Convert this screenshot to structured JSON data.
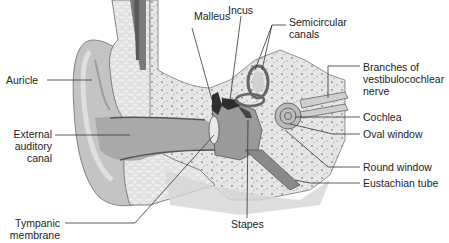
{
  "diagram": {
    "labels": {
      "malleus": "Malleus",
      "incus": "Incus",
      "semicircular_canals": [
        "Semicircular",
        "canals"
      ],
      "auricle": "Auricle",
      "branches_nerve": [
        "Branches of",
        "vestibulocochlear",
        "nerve"
      ],
      "cochlea": "Cochlea",
      "external_auditory_canal": [
        "External",
        "auditory",
        "canal"
      ],
      "oval_window": "Oval window",
      "round_window": "Round window",
      "eustachian_tube": "Eustachian tube",
      "tympanic_membrane": [
        "Tympanic",
        "membrane"
      ],
      "stapes": "Stapes"
    },
    "colors": {
      "skin": "#c8c8c8",
      "skin_dark": "#a8a8a8",
      "bone": "#e4e4e4",
      "bone_speckle": "#8a8a8a",
      "outline": "#555555",
      "ossicles": "#333333",
      "leader": "#333333",
      "text": "#222222"
    }
  }
}
